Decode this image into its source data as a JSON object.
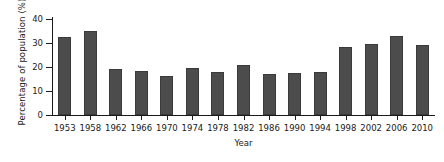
{
  "chart_data": {
    "type": "bar",
    "title": "",
    "xlabel": "Year",
    "ylabel": "Percentage of population (%)",
    "categories": [
      "1953",
      "1958",
      "1962",
      "1966",
      "1970",
      "1974",
      "1978",
      "1982",
      "1986",
      "1990",
      "1994",
      "1998",
      "2002",
      "2006",
      "2010"
    ],
    "values": [
      32.5,
      35.0,
      19.0,
      18.5,
      16.2,
      19.5,
      18.0,
      20.8,
      17.0,
      17.3,
      17.8,
      28.5,
      29.5,
      32.8,
      29.2
    ],
    "ylim": [
      0,
      40
    ],
    "yticks": [
      0,
      10,
      20,
      30,
      40
    ],
    "ytick_labels": [
      "0",
      "10",
      "20",
      "30",
      "40"
    ],
    "grid": false,
    "legend": null,
    "bar_color": "#4c4c4c",
    "axis_color": "#1a1a1a",
    "background": "#ffffff"
  }
}
